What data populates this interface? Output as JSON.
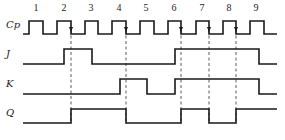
{
  "diagram": {
    "type": "timing-diagram",
    "signals": [
      {
        "name": "Cp",
        "label_y": 28,
        "low_y": 34,
        "high_y": 21,
        "start_x": 23,
        "end_x": 277,
        "edges": [
          29,
          43,
          57,
          71,
          85,
          98,
          112,
          126,
          140,
          154,
          168,
          181,
          196,
          209,
          223,
          236,
          250,
          264
        ],
        "initial": "low"
      },
      {
        "name": "J",
        "label_y": 57,
        "low_y": 64,
        "high_y": 49,
        "start_x": 23,
        "end_x": 277,
        "edges": [
          64,
          92,
          175,
          259
        ],
        "initial": "low"
      },
      {
        "name": "K",
        "label_y": 87,
        "low_y": 94,
        "high_y": 79,
        "start_x": 23,
        "end_x": 277,
        "edges": [
          120,
          147,
          175,
          259
        ],
        "initial": "low"
      },
      {
        "name": "Q",
        "label_y": 116,
        "low_y": 123,
        "high_y": 109,
        "start_x": 23,
        "end_x": 277,
        "edges": [
          71,
          126,
          181,
          209,
          236
        ],
        "initial": "low"
      }
    ],
    "clock_numbers": [
      {
        "text": "1",
        "x": 36
      },
      {
        "text": "2",
        "x": 64
      },
      {
        "text": "3",
        "x": 91
      },
      {
        "text": "4",
        "x": 119
      },
      {
        "text": "5",
        "x": 146
      },
      {
        "text": "6",
        "x": 174
      },
      {
        "text": "7",
        "x": 202
      },
      {
        "text": "8",
        "x": 229
      },
      {
        "text": "9",
        "x": 256
      }
    ],
    "clock_numbers_y": 11,
    "trigger_edges": [
      71,
      126,
      181,
      209,
      236
    ],
    "dash_top": 30,
    "dash_bottom": 124
  }
}
